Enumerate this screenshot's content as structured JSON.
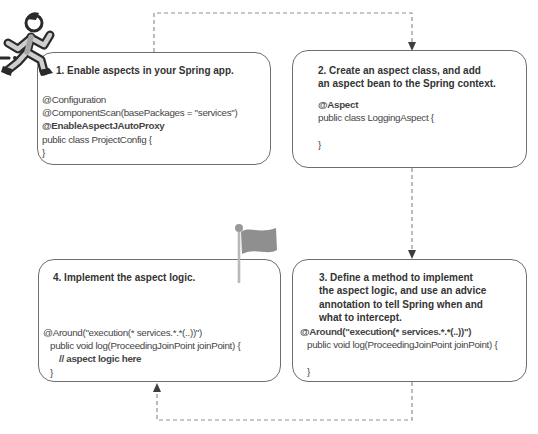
{
  "figure": {
    "steps": [
      {
        "title_lines": [
          "1. Enable aspects in your Spring app."
        ],
        "code": [
          "@Configuration",
          "@ComponentScan(basePackages = \"services\")",
          "@EnableAspectJAutoProxy",
          "public class ProjectConfig {",
          "}"
        ]
      },
      {
        "title_lines": [
          "2. Create an aspect class, and add",
          "an aspect bean to the Spring context."
        ],
        "code": [
          "@Aspect",
          "public class LoggingAspect {",
          "",
          "}"
        ]
      },
      {
        "title_lines": [
          "3. Define a method to implement",
          "the aspect logic, and use an advice",
          "annotation to tell Spring when and",
          "what to intercept."
        ],
        "code": [
          "@Around(\"execution(* services.*.*(..))\")",
          "public void log(ProceedingJoinPoint joinPoint) {",
          "",
          "}"
        ]
      },
      {
        "title_lines": [
          "4. Implement the aspect logic."
        ],
        "code": [
          "@Around(\"execution(* services.*.*(..))\")",
          "public void log(ProceedingJoinPoint joinPoint) {",
          "// aspect logic here",
          "}"
        ]
      }
    ],
    "icons": {
      "runner": "running-person",
      "flag": "milestone-flag"
    },
    "colors": {
      "box_border": "#6e6e6e",
      "title_text": "#333333",
      "code_text": "#454545",
      "connector": "#8f8f8f",
      "arrowhead": "#3d3d3d",
      "flag": "#8f8f8f",
      "flag_pole": "#b9b9b9",
      "runner_outline": "#2a2a2a",
      "runner_limbs": "#cfcfcf",
      "runner_shirt": "#a6a6a6"
    }
  }
}
